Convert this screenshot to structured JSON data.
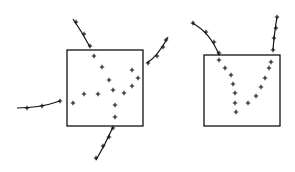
{
  "diagram": {
    "stroke_color": "#111111",
    "background": "#ffffff",
    "panels": [
      {
        "id": "left",
        "box": {
          "x": 67,
          "y": 50,
          "w": 76,
          "h": 76
        },
        "curves": [
          {
            "name": "top-incoming",
            "path": "M73,19 Q82,32 90,47",
            "markers": [
              [
                76,
                22
              ],
              [
                84,
                34
              ],
              [
                90,
                46
              ]
            ]
          },
          {
            "name": "right-outgoing",
            "path": "M147,63 Q158,56 168,37",
            "markers": [
              [
                148,
                63
              ],
              [
                157,
                56
              ],
              [
                163,
                47
              ],
              [
                166,
                40
              ]
            ]
          },
          {
            "name": "left-incoming",
            "path": "M17,108 Q40,108 60,101",
            "markers": [
              [
                27,
                108
              ],
              [
                42,
                106
              ],
              [
                60,
                101
              ]
            ]
          },
          {
            "name": "bottom-outgoing",
            "path": "M113,127 Q105,145 96,160",
            "markers": [
              [
                113,
                128
              ],
              [
                109,
                137
              ],
              [
                103,
                146
              ],
              [
                96,
                158
              ]
            ]
          }
        ],
        "inner_points": [
          [
            94,
            56
          ],
          [
            102,
            67
          ],
          [
            109,
            80
          ],
          [
            113,
            90
          ],
          [
            98,
            94
          ],
          [
            84,
            94
          ],
          [
            73,
            103
          ],
          [
            115,
            105
          ],
          [
            115,
            117
          ],
          [
            124,
            93
          ],
          [
            132,
            86
          ],
          [
            138,
            78
          ],
          [
            132,
            70
          ]
        ]
      },
      {
        "id": "right",
        "box": {
          "x": 204,
          "y": 55,
          "w": 76,
          "h": 71
        },
        "curves": [
          {
            "name": "left-incoming",
            "path": "M192,23 Q210,32 219,55",
            "markers": [
              [
                193,
                23
              ],
              [
                206,
                32
              ],
              [
                214,
                42
              ],
              [
                219,
                53
              ]
            ]
          },
          {
            "name": "right-incoming",
            "path": "M277,17 Q274,35 273,50",
            "markers": [
              [
                277,
                17
              ],
              [
                276,
                28
              ],
              [
                274,
                38
              ],
              [
                273,
                50
              ]
            ]
          }
        ],
        "inner_points": [
          [
            219,
            60
          ],
          [
            225,
            68
          ],
          [
            231,
            75
          ],
          [
            233,
            84
          ],
          [
            235,
            93
          ],
          [
            235,
            103
          ],
          [
            236,
            112
          ],
          [
            248,
            103
          ],
          [
            256,
            96
          ],
          [
            261,
            87
          ],
          [
            265,
            78
          ],
          [
            269,
            68
          ],
          [
            271,
            62
          ]
        ]
      }
    ]
  }
}
